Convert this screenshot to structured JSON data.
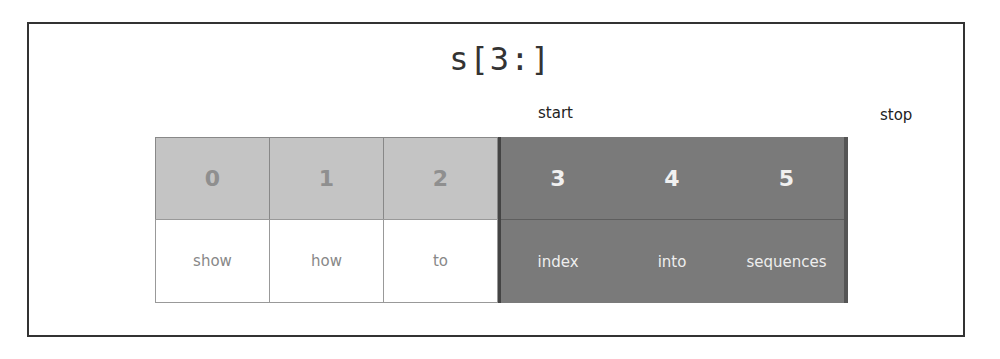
{
  "title": "s[3:]",
  "labels": {
    "start": "start",
    "stop": "stop"
  },
  "cells": [
    {
      "index": "0",
      "word": "show",
      "selected": false
    },
    {
      "index": "1",
      "word": "how",
      "selected": false
    },
    {
      "index": "2",
      "word": "to",
      "selected": false
    },
    {
      "index": "3",
      "word": "index",
      "selected": true
    },
    {
      "index": "4",
      "word": "into",
      "selected": true
    },
    {
      "index": "5",
      "word": "sequences",
      "selected": true
    }
  ],
  "colors": {
    "unselected_index_bg": "#c4c4c4",
    "unselected_word_bg": "#ffffff",
    "selected_bg": "#7a7a7a",
    "frame": "#333333"
  }
}
